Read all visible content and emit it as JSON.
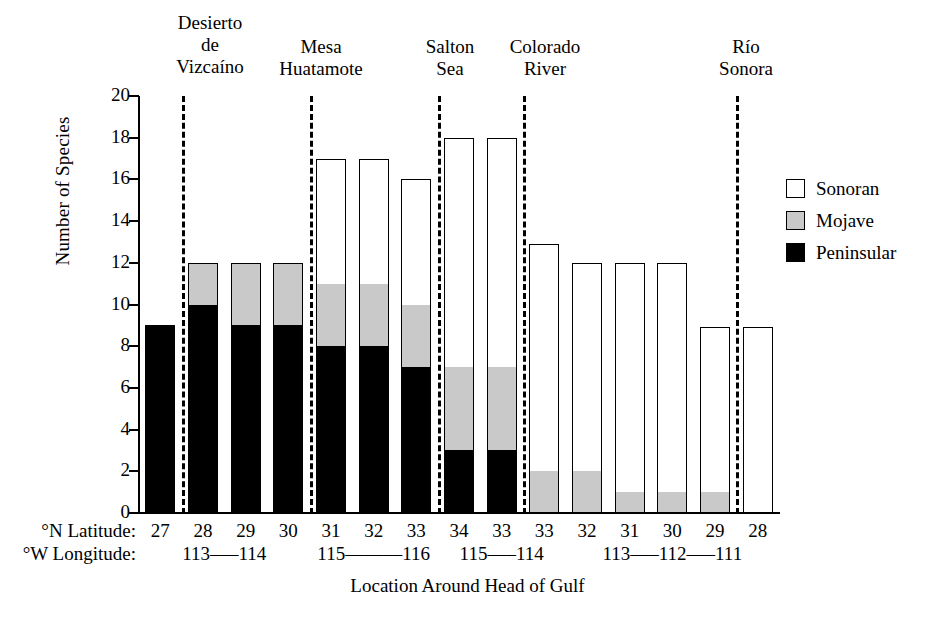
{
  "chart_data": {
    "type": "bar",
    "subtype": "stacked-bar",
    "title": "",
    "xlabel": "Location Around Head of Gulf",
    "ylabel": "Number of Species",
    "ylim": [
      0,
      20
    ],
    "ytick_step": 2,
    "yticks": [
      "20",
      "18",
      "16",
      "14",
      "12",
      "10",
      "8",
      "6",
      "4",
      "2",
      "0"
    ],
    "grid": false,
    "legend_position": "right",
    "legend": [
      {
        "name": "Sonoran",
        "color": "#ffffff"
      },
      {
        "name": "Mojave",
        "color": "#c9c9c9"
      },
      {
        "name": "Peninsular",
        "color": "#000000"
      }
    ],
    "axis_row_labels": {
      "latitude": "°N Latitude:",
      "longitude": "°W Longitude:"
    },
    "categories": [
      "27",
      "28",
      "29",
      "30",
      "31",
      "32",
      "33",
      "34",
      "33",
      "33",
      "32",
      "31",
      "30",
      "29",
      "28"
    ],
    "longitude_marks": [
      {
        "text": "113–––114",
        "start_index": 0,
        "span": 4
      },
      {
        "text": "115––––––116",
        "start_index": 4,
        "span": 3
      },
      {
        "text": "115–––114",
        "start_index": 7,
        "span": 3
      },
      {
        "text": "113–––112–––111",
        "start_index": 10,
        "span": 5
      }
    ],
    "series": [
      {
        "name": "Peninsular",
        "color": "#000000",
        "values": [
          9,
          10,
          9,
          9,
          8,
          8,
          7,
          3,
          3,
          0,
          0,
          0,
          0,
          0,
          0
        ]
      },
      {
        "name": "Mojave",
        "color": "#c9c9c9",
        "values": [
          0,
          2,
          3,
          3,
          3,
          3,
          3,
          4,
          4,
          2,
          2,
          1,
          1,
          1,
          0
        ]
      },
      {
        "name": "Sonoran",
        "color": "#ffffff",
        "values": [
          0,
          0,
          0,
          0,
          6,
          6,
          6,
          11,
          11,
          10.9,
          10,
          11,
          11,
          7.9,
          8.9
        ]
      }
    ],
    "totals": [
      9,
      12,
      12,
      12,
      17,
      17,
      16,
      18,
      18,
      12.9,
      12,
      12,
      12,
      8.9,
      8.9
    ],
    "regions": [
      {
        "label": "Desierto\nde\nVizcaíno",
        "divider_after_index": 0
      },
      {
        "label": "Mesa\nHuatamote",
        "divider_after_index": 3
      },
      {
        "label": "Salton\nSea",
        "divider_after_index": 6
      },
      {
        "label": "Colorado\nRiver",
        "divider_after_index": 8
      },
      {
        "label": "Río\nSonora",
        "divider_after_index": 13
      }
    ]
  }
}
